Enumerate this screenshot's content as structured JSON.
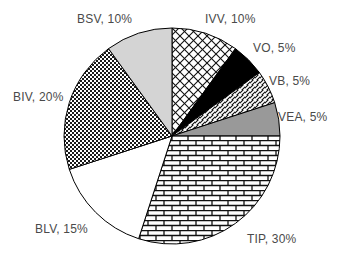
{
  "chart_data": {
    "type": "pie",
    "title": "",
    "xlabel": "",
    "ylabel": "",
    "legend_position": "none",
    "grid": false,
    "labels_format": "NAME, VALUE%",
    "start_angle_deg": 0,
    "direction": "clockwise",
    "total": 100,
    "categories": [
      "IVV",
      "VO",
      "VB",
      "VEA",
      "TIP",
      "BLV",
      "BIV",
      "BSV"
    ],
    "values": [
      10,
      5,
      5,
      5,
      30,
      15,
      20,
      10
    ],
    "slices": [
      {
        "name": "IVV",
        "value": 10,
        "label": "IVV, 10%",
        "fill": "diagonal-crosshatch",
        "color": "#ffffff"
      },
      {
        "name": "VO",
        "value": 5,
        "label": "VO, 5%",
        "fill": "solid-black",
        "color": "#000000"
      },
      {
        "name": "VB",
        "value": 5,
        "label": "VB, 5%",
        "fill": "diagonal-hatch",
        "color": "#ffffff"
      },
      {
        "name": "VEA",
        "value": 5,
        "label": "VEA, 5%",
        "fill": "solid-gray",
        "color": "#999999"
      },
      {
        "name": "TIP",
        "value": 30,
        "label": "TIP, 30%",
        "fill": "brick",
        "color": "#ffffff"
      },
      {
        "name": "BLV",
        "value": 15,
        "label": "BLV, 15%",
        "fill": "solid-white",
        "color": "#ffffff"
      },
      {
        "name": "BIV",
        "value": 20,
        "label": "BIV, 20%",
        "fill": "checkerboard",
        "color": "#3a3a3a"
      },
      {
        "name": "BSV",
        "value": 10,
        "label": "BSV, 10%",
        "fill": "solid-light-gray",
        "color": "#d4d4d4"
      }
    ],
    "label_text_color": "#4a4a4a",
    "outline_color": "#000000",
    "background_color": "#ffffff"
  }
}
